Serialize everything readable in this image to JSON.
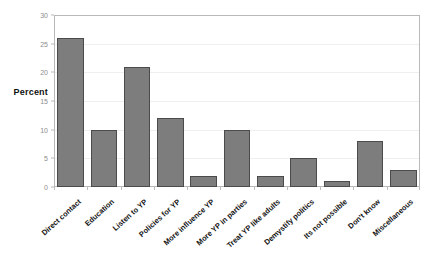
{
  "chart_data": {
    "type": "bar",
    "title": "",
    "subtitle": "",
    "xlabel": "",
    "ylabel": "Percent",
    "ylim": [
      0,
      30
    ],
    "yticks": [
      0,
      5,
      10,
      15,
      20,
      25,
      30
    ],
    "grid": true,
    "legend": null,
    "orientation": "vertical",
    "bar_color": "#7d7d7d",
    "bar_border_color": "#4b4b4b",
    "categories": [
      "Direct contact",
      "Education",
      "Listen to YP",
      "Policies for YP",
      "More influence YP",
      "More YP in parties",
      "Treat YP like adults",
      "Demystify politics",
      "Its not possible",
      "Don't know",
      "Miscellaneous"
    ],
    "values": [
      26,
      10,
      21,
      12,
      2,
      10,
      2,
      5,
      1,
      8,
      3
    ]
  },
  "axis": {
    "y_title": "Percent"
  },
  "colors": {
    "bar_fill": "#7d7d7d",
    "bar_stroke": "#4b4b4b",
    "frame": "#b9b9b9",
    "grid": "#efefef",
    "tick_text": "#8d8d8d",
    "label_text": "#141414",
    "background": "#ffffff"
  }
}
